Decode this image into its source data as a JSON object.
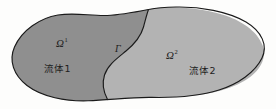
{
  "figure": {
    "type": "domain-decomposition-diagram",
    "background_color": "#fdfdfc",
    "outline_color": "#1a1a1a",
    "caption_absent": true
  },
  "regions": [
    {
      "id": "omega1",
      "symbol": "Ω",
      "superscript": "1",
      "name_label": "流体1",
      "fill_color": "#8f8f8f",
      "position": "left"
    },
    {
      "id": "omega2",
      "symbol": "Ω",
      "superscript": "2",
      "name_label": "流体2",
      "fill_color": "#b3b3b3",
      "position": "right"
    }
  ],
  "interface": {
    "id": "gamma",
    "symbol": "Γ",
    "stroke_color": "#1a1a1a"
  }
}
